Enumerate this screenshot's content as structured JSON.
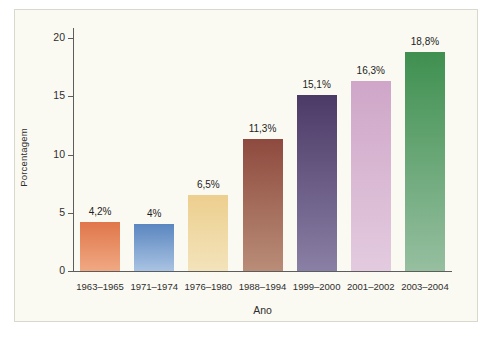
{
  "chart_data": {
    "type": "bar",
    "title": "",
    "subtitle": "",
    "xlabel": "Ano",
    "ylabel": "Porcentagem",
    "categories": [
      "1963–1965",
      "1971–1974",
      "1976–1980",
      "1988–1994",
      "1999–2000",
      "2001–2002",
      "2003–2004"
    ],
    "values": [
      4.2,
      4.0,
      6.5,
      11.3,
      15.1,
      16.3,
      18.8
    ],
    "data_labels": [
      "4,2%",
      "4%",
      "6,5%",
      "11,3%",
      "15,1%",
      "16,3%",
      "18,8%"
    ],
    "bar_colors": [
      "#e0764a",
      "#5a86c0",
      "#edcf8e",
      "#8e4a3e",
      "#4b3a66",
      "#cfa6c8",
      "#3f9050"
    ],
    "bar_colors_bottom": [
      "#f0a983",
      "#a9c3e2",
      "#f3e3bb",
      "#b98d78",
      "#8a7fa5",
      "#e3cbdf",
      "#96bfa0"
    ],
    "ylim": [
      0,
      21.5
    ],
    "yticks": [
      0,
      5,
      10,
      15,
      20
    ],
    "ytick_labels": [
      "0",
      "5",
      "10",
      "15",
      "20"
    ],
    "grid": false,
    "legend": false,
    "legend_position": "none",
    "background_color": "#fbfaf2",
    "axis_color": "#5d5d5d"
  }
}
